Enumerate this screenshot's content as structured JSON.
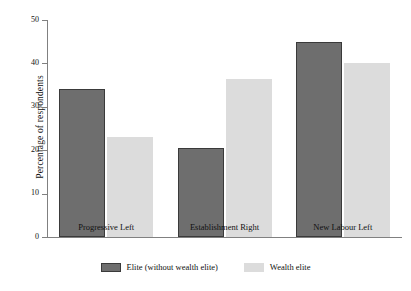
{
  "chart_data": {
    "type": "bar",
    "title": "",
    "subtitle": "",
    "xlabel": "",
    "ylabel": "Percentage of respondents",
    "categories": [
      "Progressive Left",
      "Establishment Right",
      "New Labour Left"
    ],
    "series": [
      {
        "name": "Elite (without wealth elite)",
        "color": "#6e6e6e",
        "values": [
          34,
          20.5,
          45
        ]
      },
      {
        "name": "Wealth elite",
        "color": "#dcdcdc",
        "values": [
          23,
          36.5,
          40
        ]
      }
    ],
    "ylim": [
      0,
      50
    ],
    "yticks": [
      0,
      10,
      20,
      30,
      40,
      50
    ],
    "ytick_labels": [
      "0",
      "10",
      "20",
      "30",
      "40",
      "50"
    ],
    "grid": false,
    "legend_position": "bottom-center",
    "background_color": "#ffffff",
    "axis_color": "#808080"
  }
}
